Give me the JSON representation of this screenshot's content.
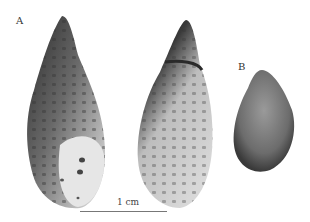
{
  "figure": {
    "panel_labels": {
      "a": "A",
      "b": "B"
    },
    "scale_bar": {
      "label": "1 cm"
    },
    "specimens": [
      {
        "id": "A-apertural",
        "panel": "A",
        "view": "apertural"
      },
      {
        "id": "A-abapertural",
        "panel": "A",
        "view": "abapertural"
      },
      {
        "id": "B-operculum",
        "panel": "B",
        "view": "operculum"
      }
    ]
  }
}
